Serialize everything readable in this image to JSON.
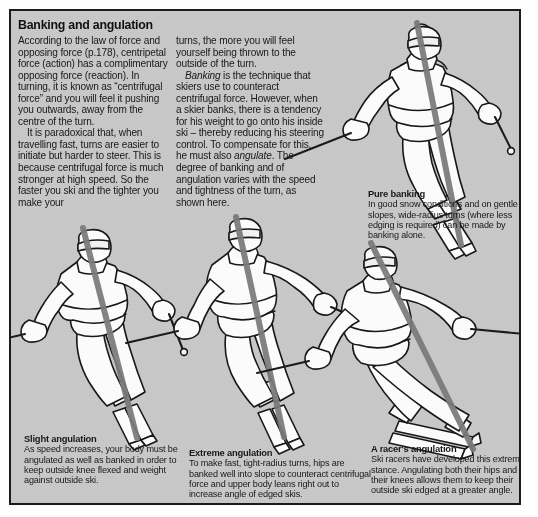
{
  "page": {
    "background": "#ffffff",
    "panel_background": "#c9c9c9",
    "border_color": "#1b1b1b",
    "text_color": "#16181a"
  },
  "article": {
    "heading": "Banking and angulation",
    "left_column": [
      "According to the law of force and opposing force (p.178), centripetal force (action) has a complimentary opposing force (reaction). In turning, it is known as “centrifugal force” and you will feel it pushing you outwards, away from the centre of the turn.",
      "It is paradoxical that, when travelling fast, turns are easier to initiate but harder to steer. This is because centrifugal force is much stronger at high speed. So the faster you ski and the tighter you make your"
    ],
    "right_column": [
      "turns, the more you will feel yourself being thrown to the outside of the turn.",
      "Banking is the technique that skiers use to counteract centrifugal force. However, when a skier banks, there is a tendency for his weight to go onto his inside ski – thereby reducing his steering control. To compensate for this, he must also angulate. The degree of banking and of angulation varies with the speed and tightness of the turn, as shown here."
    ],
    "right_column_italics": [
      "Banking",
      "angulate"
    ]
  },
  "captions": [
    {
      "id": "pure-banking",
      "title": "Pure banking",
      "body": "In good snow conditions and on gentle slopes, wide-radius turns (where less edging is required) can be made by banking alone."
    },
    {
      "id": "slight-angulation",
      "title": "Slight angulation",
      "body": "As speed increases, your body must be angulated as well as banked in order to keep outside knee flexed and weight against outside ski."
    },
    {
      "id": "extreme-angulation",
      "title": "Extreme angulation",
      "body": "To make fast, tight-radius turns, hips are banked well into slope to counteract centrifugal force and upper body leans right out to increase angle of edged skis."
    },
    {
      "id": "racers-angulation",
      "title": "A racer's angulation",
      "body": "Ski racers have developed this extreme stance. Angulating both their hips and their knees allows them to keep their outside ski edged at a greater angle."
    }
  ],
  "figures": [
    {
      "id": "skier-pure-banking",
      "label": "skier illustration — pure banking"
    },
    {
      "id": "skier-slight-angulation",
      "label": "skier illustration — slight angulation"
    },
    {
      "id": "skier-extreme-angulation",
      "label": "skier illustration — extreme angulation"
    },
    {
      "id": "skier-racers-angulation",
      "label": "skier illustration — racer's angulation"
    }
  ]
}
